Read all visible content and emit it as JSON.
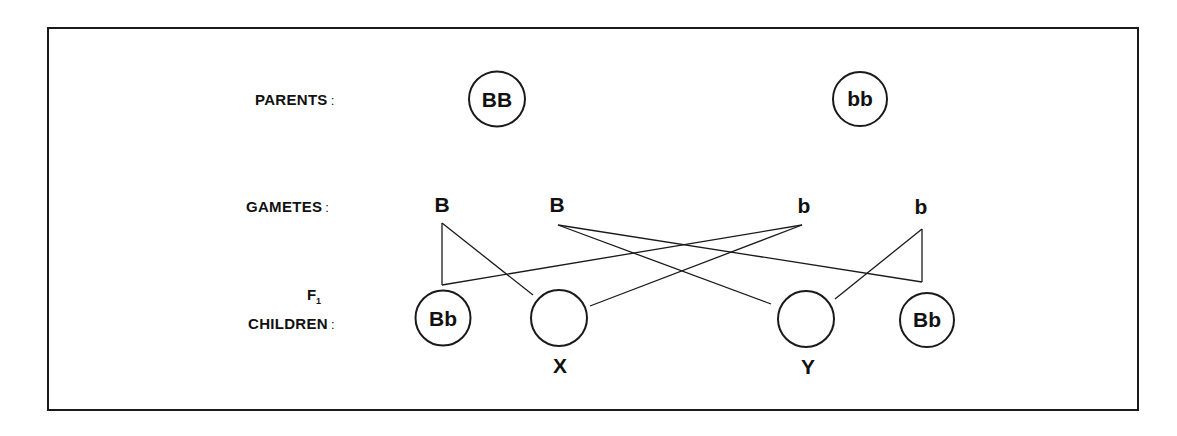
{
  "diagram": {
    "rows": {
      "parents_label": "PARENTS",
      "gametes_label": "GAMETES",
      "f1_label": "F",
      "f1_subscript": "1",
      "children_label": "CHILDREN",
      "colon": ":"
    },
    "parents": [
      {
        "id": "parent-1",
        "genotype": "BB",
        "x": 497,
        "y": 99,
        "r": 29
      },
      {
        "id": "parent-2",
        "genotype": "bb",
        "x": 860,
        "y": 99,
        "r": 28
      }
    ],
    "gametes": [
      {
        "id": "gamete-1",
        "allele": "B",
        "x": 442,
        "y": 205,
        "anchor": [
          442,
          223
        ]
      },
      {
        "id": "gamete-2",
        "allele": "B",
        "x": 557,
        "y": 205,
        "anchor": [
          558,
          225
        ]
      },
      {
        "id": "gamete-3",
        "allele": "b",
        "x": 804,
        "y": 206,
        "anchor": [
          802,
          225
        ]
      },
      {
        "id": "gamete-4",
        "allele": "b",
        "x": 921,
        "y": 207,
        "anchor": [
          922,
          229
        ]
      }
    ],
    "children": [
      {
        "id": "child-1",
        "genotype": "Bb",
        "label": "",
        "x": 443,
        "y": 318,
        "r": 29
      },
      {
        "id": "child-2",
        "genotype": "",
        "label": "X",
        "x": 559,
        "y": 318,
        "r": 29
      },
      {
        "id": "child-3",
        "genotype": "",
        "label": "Y",
        "x": 806,
        "y": 319,
        "r": 29
      },
      {
        "id": "child-4",
        "genotype": "Bb",
        "label": "",
        "x": 927,
        "y": 320,
        "r": 28
      }
    ],
    "connections": [
      {
        "from": "gamete-1",
        "to": "child-1",
        "points": [
          [
            442,
            223
          ],
          [
            442,
            285
          ]
        ]
      },
      {
        "from": "gamete-1",
        "to": "child-2",
        "points": [
          [
            442,
            223
          ],
          [
            533,
            295
          ]
        ]
      },
      {
        "from": "gamete-3",
        "to": "child-1",
        "points": [
          [
            802,
            225
          ],
          [
            442,
            285
          ]
        ]
      },
      {
        "from": "gamete-3",
        "to": "child-2",
        "points": [
          [
            802,
            225
          ],
          [
            590,
            306
          ]
        ]
      },
      {
        "from": "gamete-2",
        "to": "child-3",
        "points": [
          [
            558,
            225
          ],
          [
            771,
            304
          ]
        ]
      },
      {
        "from": "gamete-2",
        "to": "child-4",
        "points": [
          [
            558,
            225
          ],
          [
            922,
            282
          ]
        ]
      },
      {
        "from": "gamete-4",
        "to": "child-4",
        "points": [
          [
            922,
            229
          ],
          [
            922,
            282
          ]
        ]
      },
      {
        "from": "gamete-4",
        "to": "child-3",
        "points": [
          [
            922,
            229
          ],
          [
            835,
            299
          ]
        ]
      }
    ],
    "unknown_labels": {
      "x": "X",
      "y": "Y"
    }
  },
  "colors": {
    "ink": "#1a1a1a",
    "background": "#ffffff"
  }
}
